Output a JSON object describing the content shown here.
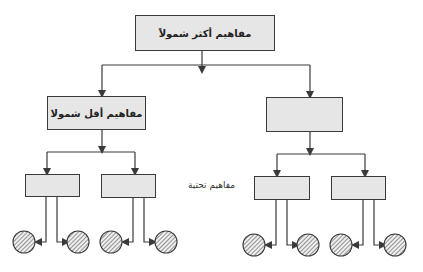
{
  "diagram": {
    "type": "hierarchical-concept-tree",
    "language": "ar",
    "top_node": {
      "label": "مفاهيم أكثر شمولاً"
    },
    "mid_nodes": [
      {
        "label": "مفاهيم أقل شمولا",
        "position": "left"
      },
      {
        "label": "",
        "position": "right"
      }
    ],
    "sub_label": "مفاهيم تحتية",
    "sub_nodes_count": 4,
    "leaf_nodes_count": 8,
    "colors": {
      "box_fill": "#e6e6e6",
      "line": "#3a3a3a",
      "circle_hatch": "#555555"
    }
  }
}
